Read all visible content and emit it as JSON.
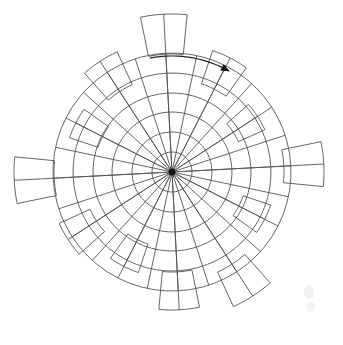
{
  "figure": {
    "title": "",
    "caption": "",
    "background_color": "#ffffff",
    "line_color": "#555555",
    "accent_color": "#111111",
    "center_x": 172,
    "center_y": 172
  },
  "chart_data": {
    "type": "bar",
    "subtype": "polar-rose",
    "title": "",
    "subtitle": "",
    "xlabel": "",
    "ylabel": "",
    "grid": true,
    "legend": false,
    "legend_position": "none",
    "angular_direction": "clockwise",
    "angular_zero_at": "top",
    "radial_ticks": [
      1,
      2,
      3,
      4,
      5,
      6
    ],
    "radial_tick_radii_px": [
      20,
      40,
      60,
      79,
      99,
      119
    ],
    "rlim": [
      0,
      6
    ],
    "spoke_count": 24,
    "spoke_step_deg": 15,
    "categories": [
      "0",
      "30",
      "60",
      "90",
      "120",
      "150",
      "180",
      "210",
      "240",
      "270",
      "300",
      "330"
    ],
    "bar_width_deg": 17,
    "values": [
      7.8,
      6.4,
      5.1,
      7.6,
      5.2,
      7.4,
      6.9,
      5.3,
      6.2,
      7.9,
      5.4,
      6.6
    ],
    "bar_angles_deg": [
      0,
      30,
      60,
      90,
      120,
      150,
      180,
      210,
      240,
      270,
      300,
      330
    ],
    "bar_outer_radii_px": [
      158,
      128,
      102,
      152,
      104,
      148,
      138,
      106,
      124,
      158,
      108,
      132
    ],
    "bar_inner_radii_px": [
      118,
      93,
      73,
      112,
      75,
      110,
      100,
      76,
      90,
      118,
      78,
      96
    ],
    "tick_labels": [],
    "annotations": [
      {
        "name": "rotation-direction-arrow",
        "kind": "curved-arrow",
        "text": "",
        "direction": "clockwise",
        "start_deg": 352,
        "end_deg": 33,
        "radius_px": 116
      }
    ]
  },
  "annotations": {
    "arrow_label": ""
  }
}
